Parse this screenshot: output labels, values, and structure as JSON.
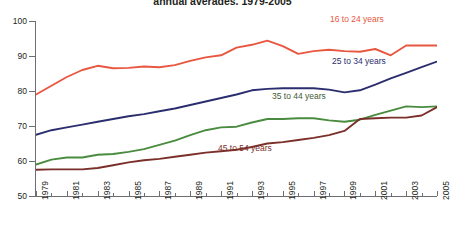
{
  "chart_data": {
    "type": "line",
    "title": "annual averages, 1979-2005",
    "xlabel": "",
    "ylabel": "",
    "ylim": [
      50,
      100
    ],
    "xlim": [
      1979,
      2005
    ],
    "grid": false,
    "legend_position": "inline-labels",
    "ytick_labels": [
      "50",
      "60",
      "70",
      "80",
      "90",
      "100"
    ],
    "ytick_values": [
      50,
      60,
      70,
      80,
      90,
      100
    ],
    "xtick_labels": [
      "1979",
      "1981",
      "1983",
      "1985",
      "1987",
      "1989",
      "1991",
      "1993",
      "1995",
      "1997",
      "1999",
      "2001",
      "2003",
      "2005"
    ],
    "xtick_values": [
      1979,
      1981,
      1983,
      1985,
      1987,
      1989,
      1991,
      1993,
      1995,
      1997,
      1999,
      2001,
      2003,
      2005
    ],
    "x": [
      1979,
      1980,
      1981,
      1982,
      1983,
      1984,
      1985,
      1986,
      1987,
      1988,
      1989,
      1990,
      1991,
      1992,
      1993,
      1994,
      1995,
      1996,
      1997,
      1998,
      1999,
      2000,
      2001,
      2002,
      2003,
      2004,
      2005
    ],
    "series": [
      {
        "name": "16 to 24 years",
        "color": "#e8573f",
        "values": [
          79.0,
          81.5,
          84.0,
          86.0,
          87.2,
          86.5,
          86.6,
          87.0,
          86.8,
          87.4,
          88.6,
          89.6,
          90.2,
          92.4,
          93.2,
          94.4,
          92.8,
          90.6,
          91.4,
          91.8,
          91.4,
          91.2,
          92.0,
          90.2,
          93.0,
          93.0,
          93.0
        ]
      },
      {
        "name": "25 to 34 years",
        "color": "#2b2e6e",
        "values": [
          67.5,
          68.8,
          69.6,
          70.4,
          71.2,
          72.0,
          72.8,
          73.4,
          74.2,
          75.0,
          76.0,
          77.0,
          78.0,
          79.0,
          80.2,
          80.6,
          80.8,
          80.8,
          80.8,
          80.4,
          79.6,
          80.2,
          81.8,
          83.6,
          85.2,
          86.8,
          88.4
        ]
      },
      {
        "name": "35 to 44 years",
        "color": "#4a8c3f",
        "values": [
          59.0,
          60.4,
          61.0,
          61.0,
          61.8,
          62.0,
          62.6,
          63.4,
          64.6,
          65.8,
          67.4,
          68.8,
          69.6,
          69.8,
          71.0,
          72.0,
          72.0,
          72.2,
          72.2,
          71.6,
          71.2,
          71.8,
          73.2,
          74.4,
          75.6,
          75.4,
          75.6
        ]
      },
      {
        "name": "45 to 54 years",
        "color": "#7b2f2a",
        "values": [
          57.5,
          57.6,
          57.6,
          57.6,
          58.0,
          58.8,
          59.6,
          60.2,
          60.6,
          61.2,
          61.8,
          62.4,
          62.8,
          63.2,
          64.0,
          65.0,
          65.4,
          66.0,
          66.6,
          67.4,
          68.6,
          72.0,
          72.2,
          72.4,
          72.4,
          73.0,
          75.4
        ]
      }
    ]
  },
  "axes": {
    "y_labels": [
      "100",
      "90",
      "80",
      "70",
      "60",
      "50"
    ],
    "x_labels": [
      "1979",
      "1981",
      "1983",
      "1985",
      "1987",
      "1989",
      "1991",
      "1993",
      "1995",
      "1997",
      "1999",
      "2001",
      "2003",
      "2005"
    ]
  },
  "series_labels": {
    "s1624": "16 to 24 years",
    "s2534": "25 to 34 years",
    "s3544": "35 to 44 years",
    "s4554": "45 to 54 years"
  },
  "colors": {
    "s1624": "#e8573f",
    "s2534": "#2b2e6e",
    "s3544": "#4a8c3f",
    "s4554": "#7b2f2a",
    "axis": "#6d6e71",
    "text": "#231f20"
  }
}
